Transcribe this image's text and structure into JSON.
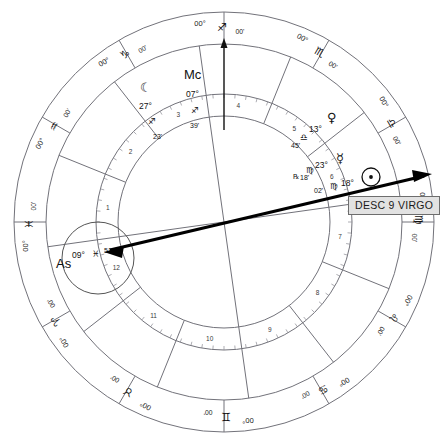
{
  "chart": {
    "type": "astrology-wheel",
    "zodiac_ring": {
      "degree_label": "00°",
      "minute_label": "00'",
      "signs": [
        {
          "name": "Sagittarius",
          "glyph": "♐",
          "cusp": "00°",
          "minute": "00'",
          "position_deg": 0
        },
        {
          "name": "Scorpio",
          "glyph": "♏",
          "cusp": "00°",
          "minute": "00'",
          "position_deg": 30
        },
        {
          "name": "Libra",
          "glyph": "♎",
          "cusp": "00°",
          "minute": "00'",
          "position_deg": 60
        },
        {
          "name": "Virgo",
          "glyph": "♍",
          "cusp": "00°",
          "minute": "00'",
          "position_deg": 90
        },
        {
          "name": "Leo",
          "glyph": "♌",
          "cusp": "00°",
          "minute": "00'",
          "position_deg": 120
        },
        {
          "name": "Cancer",
          "glyph": "♋",
          "cusp": "00°",
          "minute": "00'",
          "position_deg": 150
        },
        {
          "name": "Gemini",
          "glyph": "♊",
          "cusp": "00°",
          "minute": "00'",
          "position_deg": 180
        },
        {
          "name": "Taurus",
          "glyph": "♉",
          "cusp": "00°",
          "minute": "00'",
          "position_deg": 210
        },
        {
          "name": "Aries",
          "glyph": "♈",
          "cusp": "00°",
          "minute": "00'",
          "position_deg": 240
        },
        {
          "name": "Pisces",
          "glyph": "♓",
          "cusp": "00°",
          "minute": "00'",
          "position_deg": 270
        },
        {
          "name": "Aquarius",
          "glyph": "♒",
          "cusp": "00°",
          "minute": "00'",
          "position_deg": 300
        },
        {
          "name": "Capricorn",
          "glyph": "♑",
          "cusp": "00°",
          "minute": "00'",
          "position_deg": 330
        }
      ]
    },
    "houses": [
      {
        "number": "1",
        "angle_deg": 262
      },
      {
        "number": "2",
        "angle_deg": 292
      },
      {
        "number": "3",
        "angle_deg": 322
      },
      {
        "number": "4",
        "angle_deg": 352
      },
      {
        "number": "5",
        "angle_deg": 22
      },
      {
        "number": "6",
        "angle_deg": 52
      },
      {
        "number": "7",
        "angle_deg": 82
      },
      {
        "number": "8",
        "angle_deg": 112
      },
      {
        "number": "9",
        "angle_deg": 142
      },
      {
        "number": "10",
        "angle_deg": 172
      },
      {
        "number": "11",
        "angle_deg": 202
      },
      {
        "number": "12",
        "angle_deg": 232
      }
    ],
    "angles": [
      {
        "name": "Midheaven",
        "abbr": "Mc",
        "degree": "07°",
        "sign_glyph": "♐",
        "sign_name": "Sagittarius",
        "minute": "39'"
      },
      {
        "name": "Ascendant",
        "abbr": "As",
        "degree": "09°",
        "sign_glyph": "♓",
        "sign_name": "Pisces",
        "minute": "51'"
      }
    ],
    "planets": [
      {
        "name": "Moon",
        "glyph": "☾",
        "degree": "27°",
        "sign_glyph": "♐",
        "sign_name": "Sagittarius",
        "minute": "23'",
        "retrograde": ""
      },
      {
        "name": "Venus",
        "glyph": "♀",
        "degree": "13°",
        "sign_glyph": "♎",
        "sign_name": "Libra",
        "minute": "45'",
        "retrograde": ""
      },
      {
        "name": "Mercury",
        "glyph": "☿",
        "degree": "23°",
        "sign_glyph": "♍",
        "sign_name": "Virgo",
        "minute": "18'",
        "retrograde": "℞"
      },
      {
        "name": "Sun",
        "glyph": "☉",
        "degree": "18°",
        "sign_glyph": "♍",
        "sign_name": "Virgo",
        "minute": "02'",
        "retrograde": ""
      }
    ],
    "tooltip": {
      "label": "DESC 9 VIRGO",
      "points_to": "Descendant"
    },
    "colors": {
      "ink": "#1a1a1a",
      "line": "#6f6f77",
      "pointer": "#000000",
      "tooltip_bg": "#e2e2e2",
      "tooltip_border": "#6d6d6d",
      "background": "#ffffff"
    }
  }
}
